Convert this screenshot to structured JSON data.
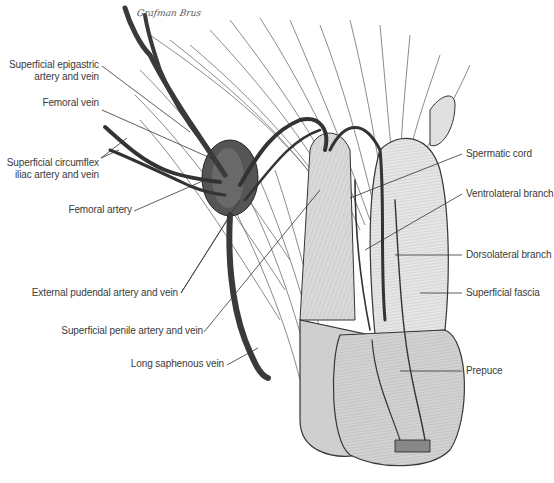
{
  "figure": {
    "type": "anatomical illustration",
    "style": "grayscale pen-and-ink drawing",
    "signature": "Grafman Brus",
    "colors": {
      "background": "#ffffff",
      "ink": "#2a2a2a",
      "vessel": "#3c3c3c",
      "label_text": "#3a3a3a",
      "leader_line": "#333333"
    }
  },
  "labels": {
    "superficial_epigastric": {
      "line1": "Superficial epigastric",
      "line2": "artery and vein"
    },
    "femoral_vein": "Femoral vein",
    "superficial_circumflex": {
      "line1": "Superficial circumflex",
      "line2": "iliac artery and vein"
    },
    "femoral_artery": "Femoral artery",
    "external_pudendal": "External pudendal artery and vein",
    "superficial_penile": "Superficial penile artery and vein",
    "long_saphenous": "Long saphenous vein",
    "spermatic_cord": "Spermatic cord",
    "ventrolateral_branch": "Ventrolateral branch",
    "dorsolateral_branch": "Dorsolateral branch",
    "superficial_fascia": "Superficial fascia",
    "prepuce": "Prepuce"
  }
}
